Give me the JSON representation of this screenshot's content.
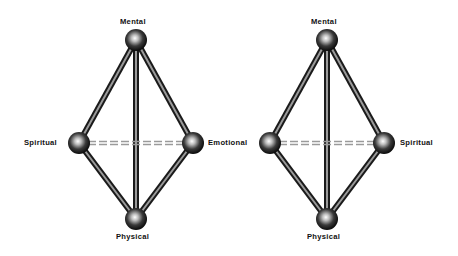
{
  "diagrams": [
    {
      "nodes": {
        "top": {
          "label": "Mental",
          "x": 136,
          "y": 40
        },
        "left": {
          "label": "Spiritual",
          "x": 79,
          "y": 143
        },
        "right": {
          "label": "Emotional",
          "x": 193,
          "y": 143
        },
        "bottom": {
          "label": "Physical",
          "x": 136,
          "y": 219
        }
      }
    },
    {
      "nodes": {
        "top": {
          "label": "Mental",
          "x": 327,
          "y": 40
        },
        "left": {
          "label": "",
          "x": 270,
          "y": 143
        },
        "right": {
          "label": "Spiritual",
          "x": 384,
          "y": 143
        },
        "bottom": {
          "label": "Physical",
          "x": 327,
          "y": 219
        }
      }
    }
  ],
  "edges": {
    "solid": [
      [
        "top",
        "left"
      ],
      [
        "top",
        "right"
      ],
      [
        "top",
        "bottom"
      ],
      [
        "left",
        "bottom"
      ],
      [
        "right",
        "bottom"
      ]
    ],
    "dashed": [
      [
        "left",
        "right"
      ]
    ]
  },
  "colors": {
    "node_dark": "#0a0a0a",
    "node_highlight": "#ffffff",
    "edge_dark": "#1a1a1a",
    "edge_light": "#9a9a9a",
    "label": "#111111"
  }
}
